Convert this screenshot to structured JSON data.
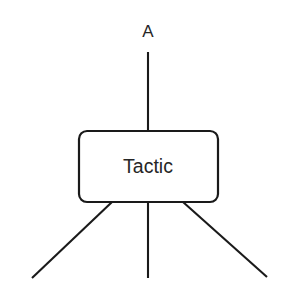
{
  "diagram": {
    "type": "block-diagram",
    "background_color": "#ffffff",
    "stroke_color": "#1a1a1a",
    "text_color": "#262626",
    "canvas": {
      "width": 292,
      "height": 304
    },
    "nodes": [
      {
        "id": "tactic",
        "label": "Tactic",
        "shape": "rounded-rectangle",
        "x": 78,
        "y": 130,
        "width": 140,
        "height": 72,
        "corner_radius": 8,
        "fill": "#ffffff",
        "stroke": "#1a1a1a",
        "label_x": 148,
        "label_y": 167
      }
    ],
    "labels": [
      {
        "id": "port-a",
        "text": "A",
        "x": 148,
        "y": 33
      }
    ],
    "edges": [
      {
        "id": "edge-top-a",
        "role": "input",
        "x1": 148,
        "y1": 52,
        "x2": 148,
        "y2": 130
      },
      {
        "id": "edge-bottom-left",
        "role": "output",
        "x1": 112,
        "y1": 203,
        "x2": 32,
        "y2": 278
      },
      {
        "id": "edge-bottom-center",
        "role": "output",
        "x1": 148,
        "y1": 203,
        "x2": 148,
        "y2": 278
      },
      {
        "id": "edge-bottom-right",
        "role": "output",
        "x1": 183,
        "y1": 203,
        "x2": 267,
        "y2": 277
      }
    ]
  }
}
